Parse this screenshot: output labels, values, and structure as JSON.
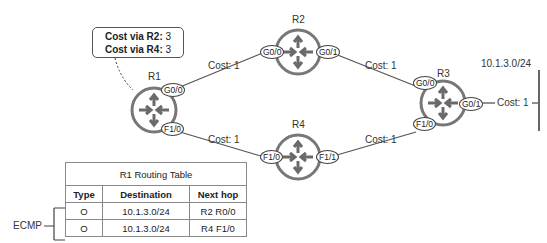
{
  "callout": {
    "line1_label": "Cost via R2:",
    "line1_value": "3",
    "line2_label": "Cost via R4:",
    "line2_value": "3"
  },
  "routers": [
    {
      "name": "R1",
      "icon": "router-icon"
    },
    {
      "name": "R2",
      "icon": "router-icon"
    },
    {
      "name": "R3",
      "icon": "router-icon"
    },
    {
      "name": "R4",
      "icon": "router-icon"
    }
  ],
  "interfaces": {
    "r1_g00": "G0/0",
    "r1_f10": "F1/0",
    "r2_g00": "G0/0",
    "r2_g01": "G0/1",
    "r3_g00": "G0/0",
    "r3_f10": "F1/0",
    "r3_g01": "G0/1",
    "r4_f10": "F1/0",
    "r4_f11": "F1/1"
  },
  "links": {
    "r1_r2": "Cost: 1",
    "r2_r3": "Cost: 1",
    "r1_r4": "Cost: 1",
    "r4_r3": "Cost: 1",
    "r3_lan": "Cost: 1"
  },
  "subnet": "10.1.3.0/24",
  "routing_table": {
    "title": "R1 Routing Table",
    "headers": [
      "Type",
      "Destination",
      "Next hop"
    ],
    "rows": [
      [
        "O",
        "10.1.3.0/24",
        "R2 R0/0"
      ],
      [
        "O",
        "10.1.3.0/24",
        "R4 F1/0"
      ]
    ]
  },
  "ecmp_label": "ECMP",
  "colors": {
    "router_stroke": "#777777",
    "arrow": "#6a6a6a",
    "line": "#555555"
  }
}
